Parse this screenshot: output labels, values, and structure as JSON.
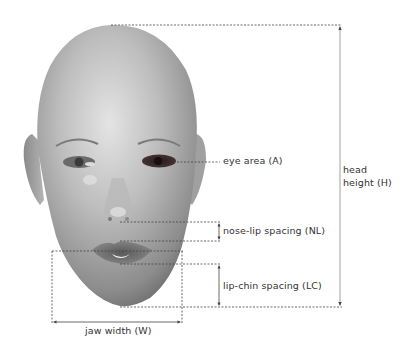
{
  "figure": {
    "colors": {
      "line": "#444444",
      "text": "#333333",
      "skin_light": "#d2d2d2",
      "skin_mid": "#a8a8a8",
      "skin_dark": "#6e6e6e"
    }
  },
  "labels": {
    "eye_area": "eye area (A)",
    "head_height_line1": "head",
    "head_height_line2": "height (H)",
    "nose_lip": "nose-lip spacing (NL)",
    "lip_chin": "lip-chin spacing (LC)",
    "jaw_width": "jaw width (W)"
  }
}
